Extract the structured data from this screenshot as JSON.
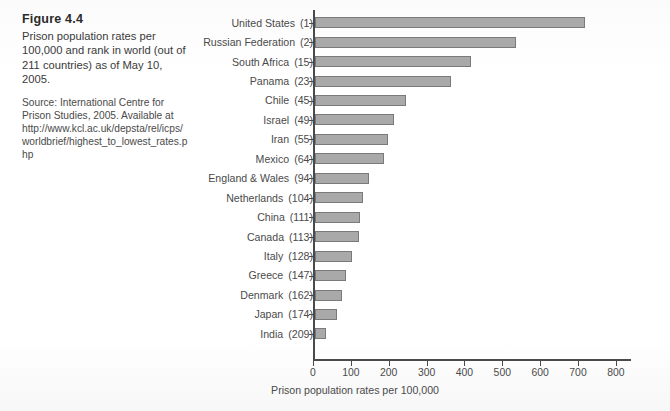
{
  "figure": {
    "number": "Figure 4.4",
    "caption": "Prison population rates per 100,000 and rank in world (out of 211 countries) as of May 10, 2005.",
    "source": "Source: International Centre for Prison Studies, 2005. Available at http://www.kcl.ac.uk/depsta/rel/icps/worldbrief/highest_to_lowest_rates.php"
  },
  "colors": {
    "bar_fill": "#a9a9a9",
    "bar_border": "#7a7a7a",
    "axis": "#4a4a4a",
    "text": "#3d3d3d",
    "background": "#fdfdfd"
  },
  "chart_data": {
    "type": "bar",
    "orientation": "horizontal",
    "title": "",
    "xlabel": "Prison population rates per 100,000",
    "ylabel": "",
    "xlim": [
      0,
      800
    ],
    "xticks": [
      0,
      100,
      200,
      300,
      400,
      500,
      600,
      700,
      800
    ],
    "xticklabels": [
      "0",
      "100",
      "200",
      "300",
      "400",
      "500",
      "600",
      "700",
      "800"
    ],
    "grid": false,
    "legend": null,
    "categories": [
      "United States",
      "Russian Federation",
      "South Africa",
      "Panama",
      "Chile",
      "Israel",
      "Iran",
      "Mexico",
      "England & Wales",
      "Netherlands",
      "China",
      "Canada",
      "Italy",
      "Greece",
      "Denmark",
      "Japan",
      "India"
    ],
    "ranks": [
      "(1)",
      "(2)",
      "(15)",
      "(23)",
      "(45)",
      "(49)",
      "(55)",
      "(64)",
      "(94)",
      "(104)",
      "(111)",
      "(113)",
      "(128)",
      "(147)",
      "(162)",
      "(174)",
      "(209)"
    ],
    "values": [
      714,
      532,
      413,
      359,
      240,
      209,
      194,
      182,
      142,
      127,
      118,
      116,
      98,
      82,
      70,
      58,
      29
    ]
  }
}
